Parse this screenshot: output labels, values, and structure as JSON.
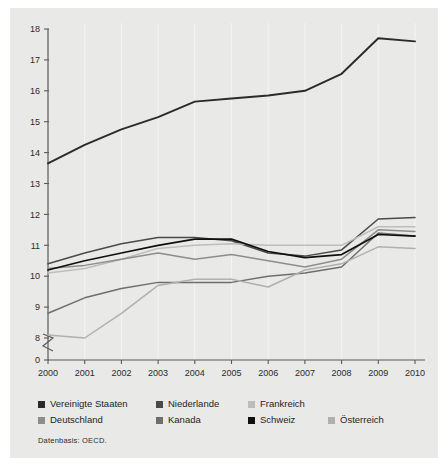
{
  "figure": {
    "source_note": "Datenbasis: OECD."
  },
  "legend": {
    "rows": [
      [
        {
          "label": "Vereinigte Staaten",
          "color": "#2b2b2b",
          "width": 118
        },
        {
          "label": "Niederlande",
          "color": "#4a4a4a",
          "width": 92
        },
        {
          "label": "Frankreich",
          "color": "#bdbdbd",
          "width": 80
        }
      ],
      [
        {
          "label": "Deutschland",
          "color": "#8d8d8d",
          "width": 118
        },
        {
          "label": "Kanada",
          "color": "#6e6e6e",
          "width": 92
        },
        {
          "label": "Schweiz",
          "color": "#101010",
          "width": 80
        },
        {
          "label": "Österreich",
          "color": "#b0b0b0",
          "width": 80
        }
      ]
    ]
  },
  "chart_data": {
    "type": "line",
    "title": "",
    "xlabel": "",
    "ylabel": "",
    "x": [
      2000,
      2001,
      2002,
      2003,
      2004,
      2005,
      2006,
      2007,
      2008,
      2009,
      2010
    ],
    "xtick_labels": [
      "2000",
      "2001",
      "2002",
      "2003",
      "2004",
      "2005",
      "2006",
      "2007",
      "2008",
      "2009",
      "2010"
    ],
    "ytick_labels": [
      "0",
      "8",
      "9",
      "10",
      "11",
      "12",
      "13",
      "14",
      "15",
      "16",
      "17",
      "18"
    ],
    "ylim": [
      8,
      18
    ],
    "axis_break": true,
    "grid": "vertical",
    "legend_position": "below",
    "series": [
      {
        "name": "Vereinigte Staaten",
        "color": "#2b2b2b",
        "width": 1.9,
        "values": [
          13.65,
          14.25,
          14.75,
          15.15,
          15.65,
          15.75,
          15.85,
          16.0,
          16.55,
          17.7,
          17.6
        ]
      },
      {
        "name": "Niederlande",
        "color": "#4a4a4a",
        "width": 1.5,
        "values": [
          10.4,
          10.75,
          11.05,
          11.25,
          11.25,
          11.15,
          10.75,
          10.65,
          10.85,
          11.85,
          11.9
        ]
      },
      {
        "name": "Frankreich",
        "color": "#bdbdbd",
        "width": 1.5,
        "values": [
          10.1,
          10.25,
          10.55,
          10.9,
          11.0,
          11.05,
          11.0,
          11.0,
          11.0,
          11.6,
          11.6
        ]
      },
      {
        "name": "Deutschland",
        "color": "#8d8d8d",
        "width": 1.5,
        "values": [
          10.25,
          10.35,
          10.55,
          10.75,
          10.55,
          10.7,
          10.5,
          10.3,
          10.55,
          11.5,
          11.45
        ]
      },
      {
        "name": "Kanada",
        "color": "#6e6e6e",
        "width": 1.5,
        "values": [
          8.8,
          9.3,
          9.6,
          9.8,
          9.8,
          9.8,
          10.0,
          10.1,
          10.3,
          11.4,
          11.3
        ]
      },
      {
        "name": "Schweiz",
        "color": "#101010",
        "width": 1.7,
        "values": [
          10.2,
          10.5,
          10.75,
          11.0,
          11.2,
          11.2,
          10.8,
          10.6,
          10.7,
          11.35,
          11.3
        ]
      },
      {
        "name": "Österreich",
        "color": "#b0b0b0",
        "width": 1.5,
        "values": [
          8.1,
          8.0,
          8.8,
          9.7,
          9.9,
          9.9,
          9.65,
          10.2,
          10.4,
          10.95,
          10.9
        ]
      }
    ]
  }
}
